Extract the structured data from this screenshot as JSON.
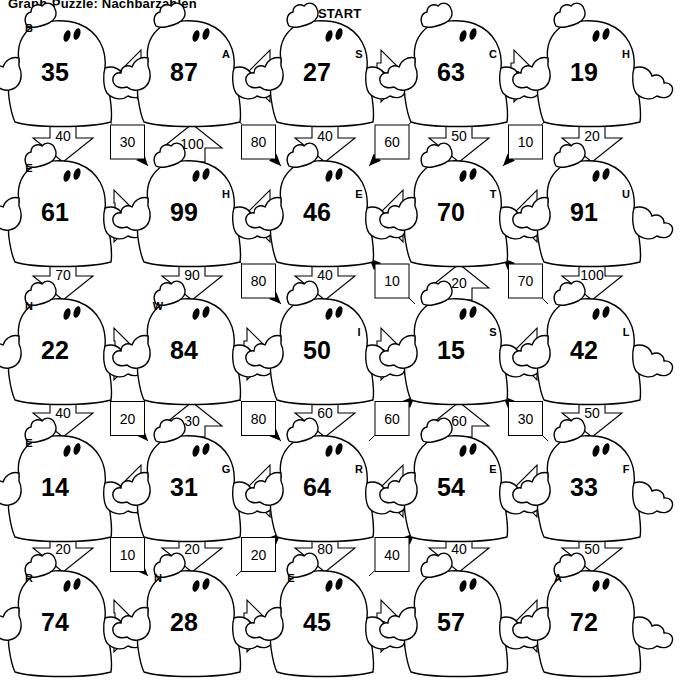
{
  "title": "Graph-Puzzle: Nachbarzahlen",
  "labels": {
    "start": "START",
    "goal": "Ziel"
  },
  "colors": {
    "ink": "#000000",
    "paper": "#ffffff"
  },
  "grid": {
    "rows": 5,
    "cols": 5
  },
  "nodes": [
    {
      "id": "n11",
      "row": 1,
      "col": 1,
      "value": "35",
      "letter": "B"
    },
    {
      "id": "n12",
      "row": 1,
      "col": 2,
      "value": "87",
      "letter": "A"
    },
    {
      "id": "n13",
      "row": 1,
      "col": 3,
      "value": "27",
      "letter": "S"
    },
    {
      "id": "n14",
      "row": 1,
      "col": 4,
      "value": "63",
      "letter": "C"
    },
    {
      "id": "n15",
      "row": 1,
      "col": 5,
      "value": "19",
      "letter": "H"
    },
    {
      "id": "n21",
      "row": 2,
      "col": 1,
      "value": "61",
      "letter": "E"
    },
    {
      "id": "n22",
      "row": 2,
      "col": 2,
      "value": "99",
      "letter": "H"
    },
    {
      "id": "n23",
      "row": 2,
      "col": 3,
      "value": "46",
      "letter": "E"
    },
    {
      "id": "n24",
      "row": 2,
      "col": 4,
      "value": "70",
      "letter": "T"
    },
    {
      "id": "n25",
      "row": 2,
      "col": 5,
      "value": "91",
      "letter": "U"
    },
    {
      "id": "n31",
      "row": 3,
      "col": 1,
      "value": "22",
      "letter": "N"
    },
    {
      "id": "n32",
      "row": 3,
      "col": 2,
      "value": "84",
      "letter": "W"
    },
    {
      "id": "n33",
      "row": 3,
      "col": 3,
      "value": "50",
      "letter": "I"
    },
    {
      "id": "n34",
      "row": 3,
      "col": 4,
      "value": "15",
      "letter": "S"
    },
    {
      "id": "n35",
      "row": 3,
      "col": 5,
      "value": "42",
      "letter": "L"
    },
    {
      "id": "n41",
      "row": 4,
      "col": 1,
      "value": "14",
      "letter": "E"
    },
    {
      "id": "n42",
      "row": 4,
      "col": 2,
      "value": "31",
      "letter": "G"
    },
    {
      "id": "n43",
      "row": 4,
      "col": 3,
      "value": "64",
      "letter": "R"
    },
    {
      "id": "n44",
      "row": 4,
      "col": 4,
      "value": "54",
      "letter": "E"
    },
    {
      "id": "n45",
      "row": 4,
      "col": 5,
      "value": "33",
      "letter": "F"
    },
    {
      "id": "n51",
      "row": 5,
      "col": 1,
      "value": "74",
      "letter": "R"
    },
    {
      "id": "n52",
      "row": 5,
      "col": 2,
      "value": "28",
      "letter": "N"
    },
    {
      "id": "n53",
      "row": 5,
      "col": 3,
      "value": "45",
      "letter": "E"
    },
    {
      "id": "n54",
      "row": 5,
      "col": 4,
      "value": "57",
      "letter": ""
    },
    {
      "id": "n55",
      "row": 5,
      "col": 5,
      "value": "72",
      "letter": "A"
    }
  ],
  "edges_horizontal": [
    {
      "row": 1,
      "gap": 1,
      "weight": "90",
      "dir": "left"
    },
    {
      "row": 1,
      "gap": 2,
      "weight": "20",
      "dir": "left"
    },
    {
      "row": 1,
      "gap": 3,
      "weight": "30",
      "dir": "right"
    },
    {
      "row": 1,
      "gap": 4,
      "weight": "70",
      "dir": "right"
    },
    {
      "row": 2,
      "gap": 1,
      "weight": "60",
      "dir": "right"
    },
    {
      "row": 2,
      "gap": 2,
      "weight": "50",
      "dir": "left"
    },
    {
      "row": 2,
      "gap": 3,
      "weight": "80",
      "dir": "left"
    },
    {
      "row": 2,
      "gap": 4,
      "weight": "90",
      "dir": "left"
    },
    {
      "row": 3,
      "gap": 1,
      "weight": "30",
      "dir": "right"
    },
    {
      "row": 3,
      "gap": 2,
      "weight": "90",
      "dir": "right"
    },
    {
      "row": 3,
      "gap": 3,
      "weight": "40",
      "dir": "right"
    },
    {
      "row": 3,
      "gap": 4,
      "weight": "40",
      "dir": "left"
    },
    {
      "row": 4,
      "gap": 1,
      "weight": "40",
      "dir": "left"
    },
    {
      "row": 4,
      "gap": 2,
      "weight": "70",
      "dir": "left"
    },
    {
      "row": 4,
      "gap": 3,
      "weight": "50",
      "dir": "left"
    },
    {
      "row": 4,
      "gap": 4,
      "weight": "40",
      "dir": "left"
    },
    {
      "row": 5,
      "gap": 1,
      "weight": "80",
      "dir": "right"
    },
    {
      "row": 5,
      "gap": 2,
      "weight": "30",
      "dir": "right"
    },
    {
      "row": 5,
      "gap": 3,
      "weight": "50",
      "dir": "right"
    },
    {
      "row": 5,
      "gap": 4,
      "weight": "70",
      "dir": "left"
    }
  ],
  "edges_vertical": [
    {
      "col": 1,
      "gap": 1,
      "weight": "40",
      "dir": "down"
    },
    {
      "col": 2,
      "gap": 1,
      "weight": "100",
      "dir": "up"
    },
    {
      "col": 3,
      "gap": 1,
      "weight": "40",
      "dir": "down"
    },
    {
      "col": 4,
      "gap": 1,
      "weight": "50",
      "dir": "down"
    },
    {
      "col": 5,
      "gap": 1,
      "weight": "20",
      "dir": "down"
    },
    {
      "col": 1,
      "gap": 2,
      "weight": "70",
      "dir": "down"
    },
    {
      "col": 2,
      "gap": 2,
      "weight": "90",
      "dir": "down"
    },
    {
      "col": 3,
      "gap": 2,
      "weight": "40",
      "dir": "down"
    },
    {
      "col": 4,
      "gap": 2,
      "weight": "20",
      "dir": "up"
    },
    {
      "col": 5,
      "gap": 2,
      "weight": "100",
      "dir": "down"
    },
    {
      "col": 1,
      "gap": 3,
      "weight": "40",
      "dir": "down"
    },
    {
      "col": 2,
      "gap": 3,
      "weight": "30",
      "dir": "up"
    },
    {
      "col": 3,
      "gap": 3,
      "weight": "60",
      "dir": "down"
    },
    {
      "col": 4,
      "gap": 3,
      "weight": "60",
      "dir": "up"
    },
    {
      "col": 5,
      "gap": 3,
      "weight": "50",
      "dir": "down"
    },
    {
      "col": 1,
      "gap": 4,
      "weight": "20",
      "dir": "down"
    },
    {
      "col": 2,
      "gap": 4,
      "weight": "20",
      "dir": "down"
    },
    {
      "col": 3,
      "gap": 4,
      "weight": "80",
      "dir": "down"
    },
    {
      "col": 4,
      "gap": 4,
      "weight": "40",
      "dir": "down"
    },
    {
      "col": 5,
      "gap": 4,
      "weight": "50",
      "dir": "down"
    }
  ],
  "edges_diagonal": [
    {
      "row": 1,
      "col": 1,
      "weight": "30",
      "dir": "down-right"
    },
    {
      "row": 1,
      "col": 2,
      "weight": "80",
      "dir": "down-right"
    },
    {
      "row": 1,
      "col": 3,
      "weight": "60",
      "dir": "down-left"
    },
    {
      "row": 1,
      "col": 4,
      "weight": "10",
      "dir": "down-left"
    },
    {
      "row": 2,
      "col": 2,
      "weight": "80",
      "dir": "down-right"
    },
    {
      "row": 2,
      "col": 3,
      "weight": "10",
      "dir": "up-left"
    },
    {
      "row": 2,
      "col": 4,
      "weight": "70",
      "dir": "up-left"
    },
    {
      "row": 3,
      "col": 1,
      "weight": "20",
      "dir": "down-right"
    },
    {
      "row": 3,
      "col": 2,
      "weight": "80",
      "dir": "down-right"
    },
    {
      "row": 3,
      "col": 3,
      "weight": "60",
      "dir": "up-right"
    },
    {
      "row": 3,
      "col": 4,
      "weight": "30",
      "dir": "up-left"
    },
    {
      "row": 4,
      "col": 1,
      "weight": "10",
      "dir": "down-right"
    },
    {
      "row": 4,
      "col": 2,
      "weight": "20",
      "dir": "up-right"
    },
    {
      "row": 4,
      "col": 3,
      "weight": "40",
      "dir": "up-right"
    }
  ]
}
